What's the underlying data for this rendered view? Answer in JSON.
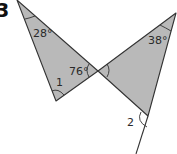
{
  "question_number": "3",
  "colors": {
    "fill": "#b9b9b9",
    "stroke": "#333333",
    "background": "#ffffff"
  },
  "triangles": [
    {
      "name": "left-triangle",
      "vertices": [
        [
          17,
          0
        ],
        [
          98,
          71
        ],
        [
          56,
          101
        ]
      ],
      "angles": [
        {
          "label": "28°",
          "at": "top"
        },
        {
          "label": "76°",
          "at": "crossing"
        },
        {
          "label": "1",
          "at": "bottom"
        }
      ]
    },
    {
      "name": "right-triangle",
      "vertices": [
        [
          98,
          71
        ],
        [
          176,
          13
        ],
        [
          148,
          116
        ]
      ],
      "angles": [
        {
          "label": "38°",
          "at": "top"
        },
        {
          "label": "",
          "at": "crossing"
        },
        {
          "label": "2",
          "at": "exterior-bottom"
        }
      ]
    }
  ],
  "labels": {
    "angle_top_left": "28°",
    "angle_top_right": "38°",
    "angle_crossing": "76°",
    "angle_1": "1",
    "angle_2": "2"
  }
}
